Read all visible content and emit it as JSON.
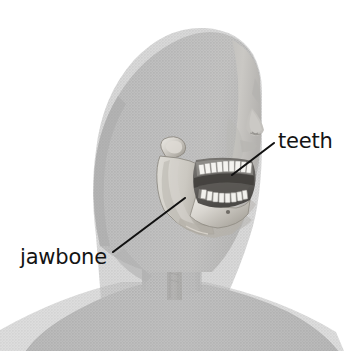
{
  "figure": {
    "background_color": "#ffffff",
    "width": 360,
    "height": 351,
    "rendering_style": "grayscale halftone engraving"
  },
  "palette": {
    "background": "#ffffff",
    "silhouette_gray": "#b9b9b9",
    "silhouette_gray_dark": "#ababab",
    "bone_light": "#e3e1dc",
    "bone_mid": "#c9c6bf",
    "bone_shadow": "#9a968f",
    "mouth_dark": "#6c6a66",
    "mouth_darkest": "#4a4845",
    "tooth_white": "#f4f3ef",
    "label_black": "#141414",
    "leader_line": "#111111"
  },
  "labels": [
    {
      "id": "teeth",
      "text": "teeth",
      "position": "upper-right",
      "text_x": 278,
      "text_y": 148,
      "anchor": "start",
      "leader_from_x": 274,
      "leader_from_y": 143,
      "leader_to_x": 232,
      "leader_to_y": 175,
      "points_to": "upper row of teeth"
    },
    {
      "id": "jawbone",
      "text": "jawbone",
      "position": "lower-left",
      "text_x": 20,
      "text_y": 264,
      "anchor": "start",
      "leader_from_x": 113,
      "leader_from_y": 252,
      "leader_to_x": 185,
      "leader_to_y": 198,
      "points_to": "mandible ramus"
    }
  ],
  "anatomy_parts": [
    {
      "name": "head-silhouette",
      "description": "rounded cranium and hair mass in halftone gray"
    },
    {
      "name": "face-profile",
      "description": "brow, nose and lips at right edge of head"
    },
    {
      "name": "mandible",
      "description": "exposed lower jawbone with ramus, condyle and body"
    },
    {
      "name": "upper-teeth-row",
      "description": "row of white maxillary teeth"
    },
    {
      "name": "lower-teeth-row",
      "description": "row of white mandibular teeth"
    },
    {
      "name": "mouth-cavity",
      "description": "dark interior of the open mouth"
    },
    {
      "name": "neck",
      "description": "neck column with darker vertical trachea band"
    },
    {
      "name": "shoulders",
      "description": "sloping shoulders cropped by the bottom edge"
    }
  ]
}
